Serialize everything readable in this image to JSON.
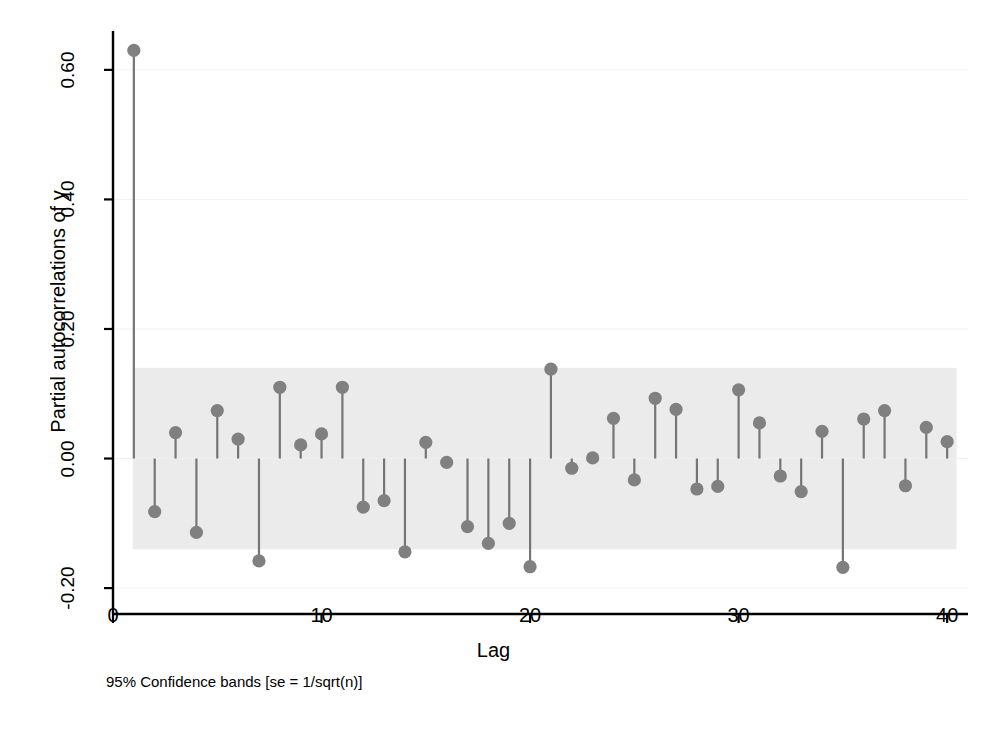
{
  "chart_data": {
    "type": "bar",
    "title": "",
    "subtitle": "",
    "xlabel": "Lag",
    "ylabel": "Partial autocorrelations of y",
    "note": "95% Confidence bands [se = 1/sqrt(n)]",
    "xlim": [
      0,
      41
    ],
    "ylim": [
      -0.24,
      0.66
    ],
    "xticks": [
      0,
      10,
      20,
      30,
      40
    ],
    "xtick_labels": [
      "0",
      "10",
      "20",
      "30",
      "40"
    ],
    "yticks": [
      -0.2,
      0.0,
      0.2,
      0.4,
      0.6
    ],
    "ytick_labels": [
      "-0.20",
      "0.00",
      "0.20",
      "0.40",
      "0.60"
    ],
    "grid": "horizontal-faint",
    "legend": "none",
    "confidence_band": {
      "label": "95% Confidence bands",
      "se_formula": "se = 1/sqrt(n)",
      "upper": 0.14,
      "lower": -0.14,
      "color": "#ebebeb"
    },
    "marker_color": "#808080",
    "stem_color": "#757575",
    "background_color": "#ffffff",
    "axis_color": "#000000",
    "categories": [
      1,
      2,
      3,
      4,
      5,
      6,
      7,
      8,
      9,
      10,
      11,
      12,
      13,
      14,
      15,
      16,
      17,
      18,
      19,
      20,
      21,
      22,
      23,
      24,
      25,
      26,
      27,
      28,
      29,
      30,
      31,
      32,
      33,
      34,
      35,
      36,
      37,
      38,
      39,
      40
    ],
    "values": [
      0.63,
      -0.082,
      0.04,
      -0.114,
      0.074,
      0.03,
      -0.158,
      0.11,
      0.021,
      0.038,
      0.11,
      -0.075,
      -0.065,
      -0.144,
      0.025,
      -0.006,
      -0.105,
      -0.131,
      -0.1,
      -0.167,
      0.138,
      -0.015,
      0.001,
      0.062,
      -0.033,
      0.093,
      0.076,
      -0.047,
      -0.043,
      0.106,
      0.055,
      -0.027,
      -0.051,
      0.042,
      -0.168,
      0.061,
      0.074,
      -0.042,
      0.048,
      0.026
    ],
    "xlabel_axis": "Lag",
    "ylabel_axis": "Partial autocorrelations of y"
  }
}
